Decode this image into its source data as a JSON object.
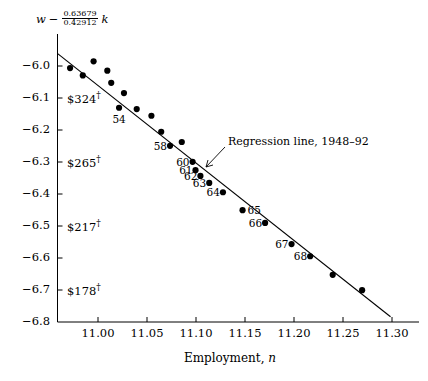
{
  "figure": {
    "background": "#ffffff",
    "ink_color": "#000000"
  },
  "axes": {
    "y_label_prefix": "w",
    "y_label_minus": "−",
    "y_label_numerator": "0.63679",
    "y_label_denominator": "0.42912",
    "y_label_suffix": "k",
    "x_title": "Employment, n",
    "x_title_var": "n",
    "x_title_text": "Employment,",
    "y_ticks": [
      "−6.0",
      "−6.1",
      "−6.2",
      "−6.3",
      "−6.4",
      "−6.5",
      "−6.6",
      "−6.7",
      "−6.8"
    ],
    "y_tick_values": [
      -6.0,
      -6.1,
      -6.2,
      -6.3,
      -6.4,
      -6.5,
      -6.6,
      -6.7,
      -6.8
    ],
    "x_ticks": [
      "11.00",
      "11.05",
      "11.10",
      "11.15",
      "11.20",
      "11.25",
      "11.30"
    ],
    "x_tick_values": [
      11.0,
      11.05,
      11.1,
      11.15,
      11.2,
      11.25,
      11.3
    ]
  },
  "wage_labels": [
    {
      "text": "$324",
      "dagger": "†",
      "y_value": -6.1
    },
    {
      "text": "$265",
      "dagger": "†",
      "y_value": -6.3
    },
    {
      "text": "$217",
      "dagger": "†",
      "y_value": -6.5
    },
    {
      "text": "$178",
      "dagger": "†",
      "y_value": -6.7
    }
  ],
  "annotations": [
    {
      "name": "regression-line-annotation",
      "text": "Regression line, 1948–92"
    }
  ],
  "chart_data": {
    "type": "scatter",
    "title": "",
    "xlabel": "Employment, n",
    "ylabel": "w − (0.63679/0.42912) k",
    "xlim": [
      10.955,
      11.315
    ],
    "ylim": [
      -6.8,
      -5.96
    ],
    "grid": false,
    "legend": null,
    "point_radius_px": 3.1,
    "series": [
      {
        "name": "Annual observations 1948–92",
        "marker": "filled-circle",
        "color": "#000000",
        "points": [
          {
            "label": "",
            "x": 10.9715,
            "y": -6.0065
          },
          {
            "label": "",
            "x": 10.9845,
            "y": -6.0295
          },
          {
            "label": "",
            "x": 10.9955,
            "y": -5.9855
          },
          {
            "label": "",
            "x": 11.0095,
            "y": -6.0145
          },
          {
            "label": "",
            "x": 11.0135,
            "y": -6.0525
          },
          {
            "label": "54",
            "x": 11.0215,
            "y": -6.1305,
            "label_pos": "below"
          },
          {
            "label": "",
            "x": 11.0265,
            "y": -6.0845
          },
          {
            "label": "",
            "x": 11.0395,
            "y": -6.1345
          },
          {
            "label": "",
            "x": 11.0545,
            "y": -6.1555
          },
          {
            "label": "58",
            "x": 11.0735,
            "y": -6.2495,
            "label_pos": "left"
          },
          {
            "label": "",
            "x": 11.0645,
            "y": -6.2055
          },
          {
            "label": "",
            "x": 11.0855,
            "y": -6.2375
          },
          {
            "label": "60",
            "x": 11.0965,
            "y": -6.2995,
            "label_pos": "left"
          },
          {
            "label": "61",
            "x": 11.0995,
            "y": -6.3255,
            "label_pos": "left"
          },
          {
            "label": "62",
            "x": 11.1045,
            "y": -6.3435,
            "label_pos": "left"
          },
          {
            "label": "63",
            "x": 11.1135,
            "y": -6.3655,
            "label_pos": "left"
          },
          {
            "label": "64",
            "x": 11.1275,
            "y": -6.3945,
            "label_pos": "left"
          },
          {
            "label": "65",
            "x": 11.1475,
            "y": -6.4505,
            "label_pos": "right"
          },
          {
            "label": "66",
            "x": 11.1705,
            "y": -6.4905,
            "label_pos": "left"
          },
          {
            "label": "67",
            "x": 11.1975,
            "y": -6.5565,
            "label_pos": "left"
          },
          {
            "label": "68",
            "x": 11.2165,
            "y": -6.5945,
            "label_pos": "left"
          },
          {
            "label": "",
            "x": 11.2395,
            "y": -6.6525
          },
          {
            "label": "",
            "x": 11.2695,
            "y": -6.7005
          }
        ]
      }
    ],
    "regression_line": {
      "name": "Regression line, 1948–92",
      "x_start": 10.9585,
      "y_start": -5.9605,
      "x_end": 11.2985,
      "y_end": -6.7835
    }
  }
}
